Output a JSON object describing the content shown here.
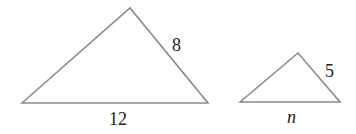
{
  "figure": {
    "stroke_color": "#8a8a8a",
    "text_color": "#222222",
    "large_triangle": {
      "side_label": "8",
      "base_label": "12"
    },
    "small_triangle": {
      "side_label": "5",
      "base_label": "n"
    }
  }
}
